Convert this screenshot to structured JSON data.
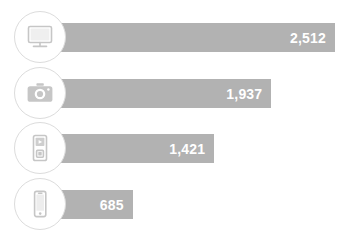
{
  "chart_data": {
    "type": "bar",
    "orientation": "horizontal",
    "title": "",
    "subtitle": "",
    "xlabel": "",
    "ylabel": "",
    "grid": false,
    "legend": "none",
    "xlim": [
      0,
      2512
    ],
    "categories": [
      "Desktop computer",
      "Digital camera",
      "Portable media player",
      "Smartphone"
    ],
    "values": [
      2512,
      1937,
      1421,
      685
    ],
    "value_labels": [
      "2,512",
      "1,937",
      "1,421",
      "685"
    ],
    "icons": [
      "monitor-icon",
      "camera-icon",
      "media-player-icon",
      "smartphone-icon"
    ],
    "colors": {
      "bar_fill": "#b2b2b2",
      "value_text": "#ffffff",
      "badge_background": "#ffffff",
      "badge_border": "#dcdcdc",
      "icon": "#c6c6c6",
      "background": "#ffffff"
    }
  },
  "rows": [
    {
      "label": "Desktop computer",
      "value_label": "2,512",
      "icon": "monitor-icon"
    },
    {
      "label": "Digital camera",
      "value_label": "1,937",
      "icon": "camera-icon"
    },
    {
      "label": "Portable media player",
      "value_label": "1,421",
      "icon": "media-player-icon"
    },
    {
      "label": "Smartphone",
      "value_label": "685",
      "icon": "smartphone-icon"
    }
  ]
}
